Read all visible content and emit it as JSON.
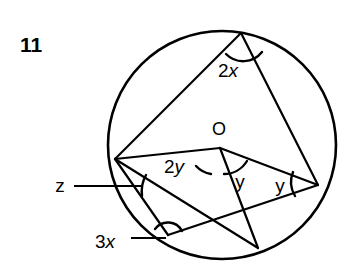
{
  "figure": {
    "item_number": "11",
    "background_color": "#ffffff",
    "stroke_color": "#000000",
    "canvas": {
      "width": 343,
      "height": 279
    },
    "circle": {
      "cx": 222,
      "cy": 145,
      "r": 114,
      "stroke_width": 2.6
    },
    "points": {
      "top": {
        "x": 241,
        "y": 33,
        "label": ""
      },
      "left": {
        "x": 115,
        "y": 159,
        "label": ""
      },
      "right": {
        "x": 318,
        "y": 185,
        "label": ""
      },
      "bottom_left": {
        "x": 168,
        "y": 235,
        "label": ""
      },
      "bottom_right": {
        "x": 258,
        "y": 248,
        "label": ""
      },
      "center": {
        "x": 220,
        "y": 148,
        "label": "O"
      }
    },
    "center_label": {
      "text": "O",
      "x": 219,
      "y": 135
    },
    "chords": [
      {
        "name": "top-to-left",
        "x1": 241,
        "y1": 33,
        "x2": 115,
        "y2": 159
      },
      {
        "name": "top-to-right",
        "x1": 241,
        "y1": 33,
        "x2": 318,
        "y2": 185
      },
      {
        "name": "left-to-center",
        "x1": 115,
        "y1": 159,
        "x2": 220,
        "y2": 148
      },
      {
        "name": "center-to-right",
        "x1": 220,
        "y1": 148,
        "x2": 318,
        "y2": 185
      },
      {
        "name": "center-to-bottomright",
        "x1": 220,
        "y1": 148,
        "x2": 258,
        "y2": 248
      },
      {
        "name": "left-to-bottomleft",
        "x1": 115,
        "y1": 159,
        "x2": 168,
        "y2": 235
      },
      {
        "name": "left-to-bottomright",
        "x1": 115,
        "y1": 159,
        "x2": 258,
        "y2": 248
      },
      {
        "name": "bottomleft-to-right",
        "x1": 168,
        "y1": 235,
        "x2": 318,
        "y2": 185
      }
    ],
    "angle_marks": [
      {
        "name": "angle-2x-at-top-vertex",
        "label": "2x",
        "label_prefix": "2",
        "label_variable": "x",
        "label_x": 228,
        "label_y": 77,
        "arc_path": "M 226 54 A 24 24 0 0 0 262 52"
      },
      {
        "name": "angle-2y-at-center",
        "label": "2y",
        "label_prefix": "2",
        "label_variable": "y",
        "label_x": 174,
        "label_y": 173,
        "arc_path": "M 196 166 A 26 26 0 0 0 211 174"
      },
      {
        "name": "angle-y-at-center",
        "label": "y",
        "label_prefix": "",
        "label_variable": "y",
        "label_x": 240,
        "label_y": 188,
        "arc_path": "M 224 174 A 27 27 0 0 0 247 161"
      },
      {
        "name": "angle-y-at-right-vertex",
        "label": "y",
        "label_prefix": "",
        "label_variable": "y",
        "label_x": 280,
        "label_y": 192,
        "arc_path": "M 293 172 A 27 27 0 0 0 295 196"
      },
      {
        "name": "angle-z-at-left-vertex",
        "label": "z",
        "label_prefix": "",
        "label_variable": "z",
        "label_x": 60,
        "label_y": 192,
        "arc_path": "M 146 175 A 34 34 0 0 0 142 196",
        "leader": {
          "x1": 74,
          "y1": 186,
          "x2": 141,
          "y2": 186
        }
      },
      {
        "name": "angle-3x-at-bottom-left-vertex",
        "label": "3x",
        "label_prefix": "3",
        "label_variable": "x",
        "label_x": 105,
        "label_y": 248,
        "arc_path": "M 155 229 A 16 16 0 0 1 182 231",
        "leader": {
          "x1": 131,
          "y1": 238,
          "x2": 166,
          "y2": 238
        }
      }
    ],
    "item_number_position": {
      "x": 20,
      "y": 52
    }
  }
}
